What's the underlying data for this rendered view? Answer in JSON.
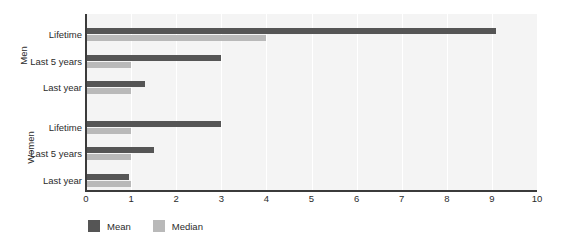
{
  "chart_data": {
    "type": "bar",
    "orientation": "horizontal",
    "title": "",
    "subtitle": "",
    "xlabel": "",
    "ylabel": "",
    "xlim": [
      0,
      10
    ],
    "xticks": [
      "0",
      "1",
      "2",
      "3",
      "4",
      "5",
      "6",
      "7",
      "8",
      "9",
      "10"
    ],
    "grid": true,
    "grid_axis": "x",
    "legend_position": "bottom-left",
    "groups": [
      {
        "name": "Men",
        "categories": [
          "Lifetime",
          "Last 5 years",
          "Last year"
        ],
        "series": [
          {
            "name": "Mean",
            "values": [
              9.1,
              3.0,
              1.3
            ]
          },
          {
            "name": "Median",
            "values": [
              4.0,
              1.0,
              1.0
            ]
          }
        ]
      },
      {
        "name": "Women",
        "categories": [
          "Lifetime",
          "Last 5 years",
          "Last year"
        ],
        "series": [
          {
            "name": "Mean",
            "values": [
              3.0,
              1.5,
              0.95
            ]
          },
          {
            "name": "Median",
            "values": [
              1.0,
              1.0,
              1.0
            ]
          }
        ]
      }
    ],
    "legend": [
      {
        "label": "Mean",
        "color": "#555555"
      },
      {
        "label": "Median",
        "color": "#b9b9b9"
      }
    ],
    "colors": {
      "mean": "#555555",
      "median": "#b9b9b9",
      "plot_background": "#f4f4f4",
      "gridline": "#ffffff",
      "axis": "#3b3b3b",
      "text": "#2b2b2b",
      "page_background": "#ffffff"
    }
  }
}
